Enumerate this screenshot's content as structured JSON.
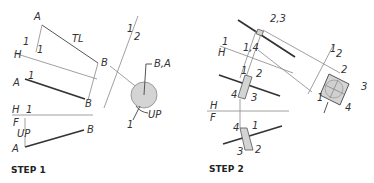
{
  "step1": {
    "title": "STEP 1",
    "labels": {
      "a_top": "A",
      "tl": "TL",
      "one_top": "1",
      "one_arrow": "1",
      "h_top": "H",
      "b_top": "B",
      "one_left": "1",
      "a_mid": "A",
      "b_mid": "B",
      "h_fold": "H",
      "one_fold": "1",
      "f_fold": "F",
      "up_front": "UP",
      "a_bottom": "A",
      "b_bottom": "B",
      "plane_1": "1",
      "plane_2": "2",
      "ba_point": "B,A",
      "up_view": "UP",
      "one_view": "1"
    }
  },
  "step2": {
    "title": "STEP 2",
    "labels": {
      "twothree": "2,3",
      "one_h": "1",
      "h": "H",
      "onefour": "1,4",
      "one_top": "1",
      "two_top": "2",
      "four_top": "4",
      "three_top": "3",
      "h_fold": "H",
      "f_fold": "F",
      "four_front": "4",
      "one_front": "1",
      "three_front": "3",
      "two_front": "2",
      "plane_1": "1",
      "plane_2": "2",
      "sq_2": "2",
      "sq_3": "3",
      "sq_4": "4",
      "sq_1": "1"
    }
  },
  "colors": {
    "shade": "#d4d4d4",
    "line": "#333333"
  }
}
